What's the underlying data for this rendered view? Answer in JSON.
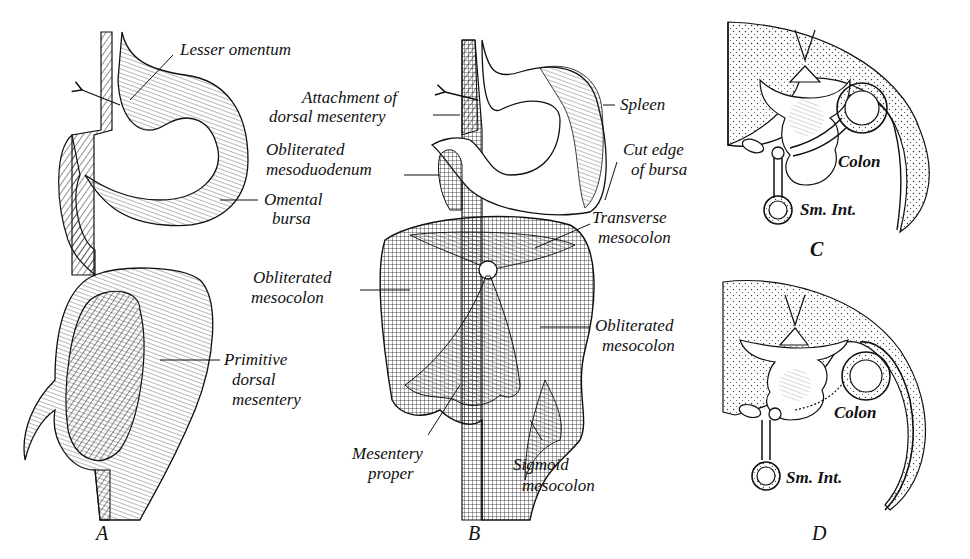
{
  "figure": {
    "panels": [
      {
        "id": "A",
        "letter": "A"
      },
      {
        "id": "B",
        "letter": "B"
      },
      {
        "id": "C",
        "letter": "C"
      },
      {
        "id": "D",
        "letter": "D"
      }
    ],
    "labels": {
      "A": {
        "lesser_omentum": "Lesser omentum",
        "omental_bursa_1": "Omental",
        "omental_bursa_2": "bursa",
        "primitive_1": "Primitive",
        "primitive_2": "dorsal",
        "primitive_3": "mesentery"
      },
      "B": {
        "attachment_1": "Attachment of",
        "attachment_2": "dorsal mesentery",
        "oblit_meso_duo_1": "Obliterated",
        "oblit_meso_duo_2": "mesoduodenum",
        "spleen": "Spleen",
        "cut_edge_1": "Cut edge",
        "cut_edge_2": "of bursa",
        "transverse_1": "Transverse",
        "transverse_2": "mesocolon",
        "oblit_left_1": "Obliterated",
        "oblit_left_2": "mesocolon",
        "oblit_right_1": "Obliterated",
        "oblit_right_2": "mesocolon",
        "mesentery_proper_1": "Mesentery",
        "mesentery_proper_2": "proper",
        "sigmoid_1": "Sigmoid",
        "sigmoid_2": "mesocolon"
      },
      "C": {
        "colon": "Colon",
        "sm_int": "Sm. Int."
      },
      "D": {
        "colon": "Colon",
        "sm_int": "Sm. Int."
      }
    }
  }
}
